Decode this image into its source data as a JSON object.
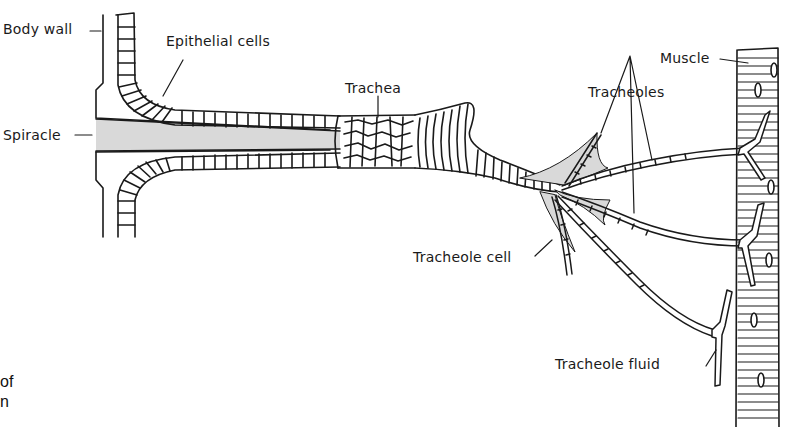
{
  "diagram": {
    "labels": {
      "body_wall": "Body wall",
      "epithelial_cells": "Epithelial cells",
      "spiracle": "Spiracle",
      "trachea": "Trachea",
      "tracheoles": "Tracheoles",
      "muscle": "Muscle",
      "tracheole_cell": "Tracheole cell",
      "tracheole_fluid": "Tracheole fluid"
    },
    "caption_fragment": [
      "of",
      "n"
    ],
    "colors": {
      "line": "#1a1a1a",
      "air_fill": "#d9d9d9",
      "background": "#ffffff"
    }
  }
}
